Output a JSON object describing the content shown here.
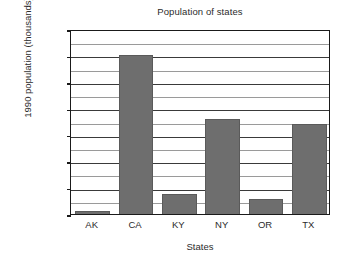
{
  "chart_data": {
    "type": "bar",
    "title": "Population of states",
    "xlabel": "States",
    "ylabel": "1990 population (thousands)",
    "categories": [
      "AK",
      "CA",
      "KY",
      "NY",
      "OR",
      "TX"
    ],
    "values": [
      550,
      30000,
      3700,
      18000,
      2850,
      17000
    ],
    "series": [
      {
        "name": "1990 population",
        "values": [
          550,
          30000,
          3700,
          18000,
          2850,
          17000
        ]
      }
    ],
    "ylim": [
      0,
      35000
    ],
    "ytick_labels": [
      "0",
      "5000",
      "10000",
      "15000",
      "20000",
      "25000",
      "30000",
      "35000"
    ],
    "ytick_values": [
      0,
      5000,
      10000,
      15000,
      20000,
      25000,
      30000,
      35000
    ],
    "minor_ytick_values": [
      2500,
      7500,
      12500,
      17500,
      22500,
      27500,
      32500
    ],
    "grid": true,
    "legend": false,
    "bar_color": "#6e6e6e",
    "axis_color": "#1a1a1a",
    "background": "#ffffff"
  }
}
